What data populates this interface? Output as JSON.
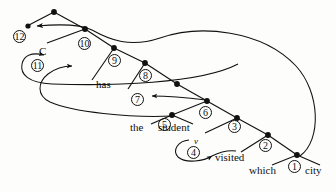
{
  "figure": {
    "type": "parse-tree-derivation",
    "title": "",
    "background_color": "#fdfdfc",
    "ink_color": "#111111"
  },
  "words": [
    {
      "id": "w-has",
      "text": "has",
      "x": 96,
      "y": 85
    },
    {
      "id": "w-the",
      "text": "the",
      "x": 130,
      "y": 128
    },
    {
      "id": "w-student",
      "text": "student",
      "x": 158,
      "y": 128
    },
    {
      "id": "w-visited",
      "text": "visited",
      "x": 215,
      "y": 158
    },
    {
      "id": "w-which",
      "text": "which",
      "x": 249,
      "y": 171
    },
    {
      "id": "w-city",
      "text": "city",
      "x": 305,
      "y": 171
    }
  ],
  "category_labels": [
    {
      "id": "cat-C",
      "text": "C",
      "x": 39,
      "y": 46
    },
    {
      "id": "cat-v",
      "text": "v",
      "x": 194,
      "y": 137
    }
  ],
  "numbered_nodes": [
    {
      "id": "n12",
      "label": "12",
      "x": 13,
      "y": 30,
      "dot_x": 28,
      "dot_y": 26
    },
    {
      "id": "n11",
      "label": "11",
      "x": 31,
      "y": 59,
      "dot_x": null,
      "dot_y": null
    },
    {
      "id": "n10",
      "label": "10",
      "x": 78,
      "y": 37,
      "dot_x": 85,
      "dot_y": 29
    },
    {
      "id": "n9",
      "label": "9",
      "x": 108,
      "y": 54,
      "dot_x": 114,
      "dot_y": 48
    },
    {
      "id": "n8",
      "label": "8",
      "x": 139,
      "y": 69,
      "dot_x": 145,
      "dot_y": 63
    },
    {
      "id": "n7",
      "label": "7",
      "x": 131,
      "y": 93,
      "dot_x": null,
      "dot_y": null
    },
    {
      "id": "n6",
      "label": "6",
      "x": 199,
      "y": 106,
      "dot_x": 207,
      "dot_y": 101
    },
    {
      "id": "n5",
      "label": "5",
      "x": 158,
      "y": 118,
      "dot_x": 172,
      "dot_y": 115
    },
    {
      "id": "n4",
      "label": "4",
      "x": 187,
      "y": 146,
      "dot_x": null,
      "dot_y": null
    },
    {
      "id": "n3",
      "label": "3",
      "x": 228,
      "y": 120,
      "dot_x": 237,
      "dot_y": 118
    },
    {
      "id": "n2",
      "label": "2",
      "x": 259,
      "y": 139,
      "dot_x": 268,
      "dot_y": 135
    },
    {
      "id": "n1",
      "label": "1",
      "x": 288,
      "y": 160,
      "dot_x": 297,
      "dot_y": 155
    }
  ],
  "plain_dots": [
    {
      "id": "dot-root",
      "x": 54,
      "y": 12
    },
    {
      "id": "dot-n7",
      "x": 177,
      "y": 84
    }
  ],
  "tree_edges": [
    {
      "id": "e-root-12",
      "from": "dot-root",
      "to": "n12-dot",
      "x1": 54,
      "y1": 12,
      "x2": 28,
      "y2": 26
    },
    {
      "id": "e-root-10",
      "from": "dot-root",
      "to": "n10",
      "x1": 54,
      "y1": 12,
      "x2": 85,
      "y2": 29
    },
    {
      "id": "e-10-11",
      "from": "n10",
      "to": "C",
      "x1": 85,
      "y1": 29,
      "x2": 47,
      "y2": 43
    },
    {
      "id": "e-10-9",
      "from": "n10",
      "to": "n9",
      "x1": 85,
      "y1": 29,
      "x2": 114,
      "y2": 48
    },
    {
      "id": "e-9-has",
      "from": "n9",
      "to": "w-has",
      "x1": 114,
      "y1": 48,
      "x2": 90,
      "y2": 80
    },
    {
      "id": "e-9-8",
      "from": "n9",
      "to": "n8",
      "x1": 114,
      "y1": 48,
      "x2": 145,
      "y2": 63
    },
    {
      "id": "e-8-7",
      "from": "n8",
      "to": "n7",
      "x1": 145,
      "y1": 63,
      "x2": 128,
      "y2": 88
    },
    {
      "id": "e-8-dot7",
      "from": "n8",
      "to": "dot-n7",
      "x1": 145,
      "y1": 63,
      "x2": 177,
      "y2": 84
    },
    {
      "id": "e-dot7-6",
      "from": "dot-n7",
      "to": "n6",
      "x1": 177,
      "y1": 84,
      "x2": 207,
      "y2": 101
    },
    {
      "id": "e-6-5",
      "from": "n6",
      "to": "n5",
      "x1": 207,
      "y1": 101,
      "x2": 172,
      "y2": 115
    },
    {
      "id": "e-5-the",
      "from": "n5",
      "to": "w-the",
      "x1": 172,
      "y1": 115,
      "x2": 149,
      "y2": 124
    },
    {
      "id": "e-5-stud",
      "from": "n5",
      "to": "w-student",
      "x1": 172,
      "y1": 115,
      "x2": 191,
      "y2": 124
    },
    {
      "id": "e-6-3",
      "from": "n6",
      "to": "n3",
      "x1": 207,
      "y1": 101,
      "x2": 237,
      "y2": 118
    },
    {
      "id": "e-3-v",
      "from": "n3",
      "to": "cat-v",
      "x1": 237,
      "y1": 118,
      "x2": 203,
      "y2": 132
    },
    {
      "id": "e-3-2",
      "from": "n3",
      "to": "n2",
      "x1": 237,
      "y1": 118,
      "x2": 268,
      "y2": 135
    },
    {
      "id": "e-2-vis",
      "from": "n2",
      "to": "w-visited",
      "x1": 268,
      "y1": 135,
      "x2": 240,
      "y2": 152
    },
    {
      "id": "e-2-1",
      "from": "n2",
      "to": "n1",
      "x1": 268,
      "y1": 135,
      "x2": 297,
      "y2": 155
    },
    {
      "id": "e-1-which",
      "from": "n1",
      "to": "w-which",
      "x1": 297,
      "y1": 155,
      "x2": 271,
      "y2": 165
    },
    {
      "id": "e-1-city",
      "from": "n1",
      "to": "w-city",
      "x1": 297,
      "y1": 155,
      "x2": 320,
      "y2": 165
    }
  ],
  "movement_arcs": [
    {
      "id": "arc-1-to-12",
      "description": "long arc from node 1 up to node 12",
      "arrow_target": "n12"
    },
    {
      "id": "arc-2-to-11",
      "description": "arc from lower right sweeping left to node 11 (C)",
      "arrow_target": "n11"
    },
    {
      "id": "arc-5-to-mid",
      "description": "arc from node 5 sweeping left then up",
      "arrow_target": "mid-left"
    },
    {
      "id": "arc-6-to-7",
      "description": "short arc from node 6 left into node 7",
      "arrow_target": "n7"
    },
    {
      "id": "arc-4-loop",
      "description": "small loop under node 4 pointing right to v",
      "arrow_target": "cat-v"
    }
  ]
}
